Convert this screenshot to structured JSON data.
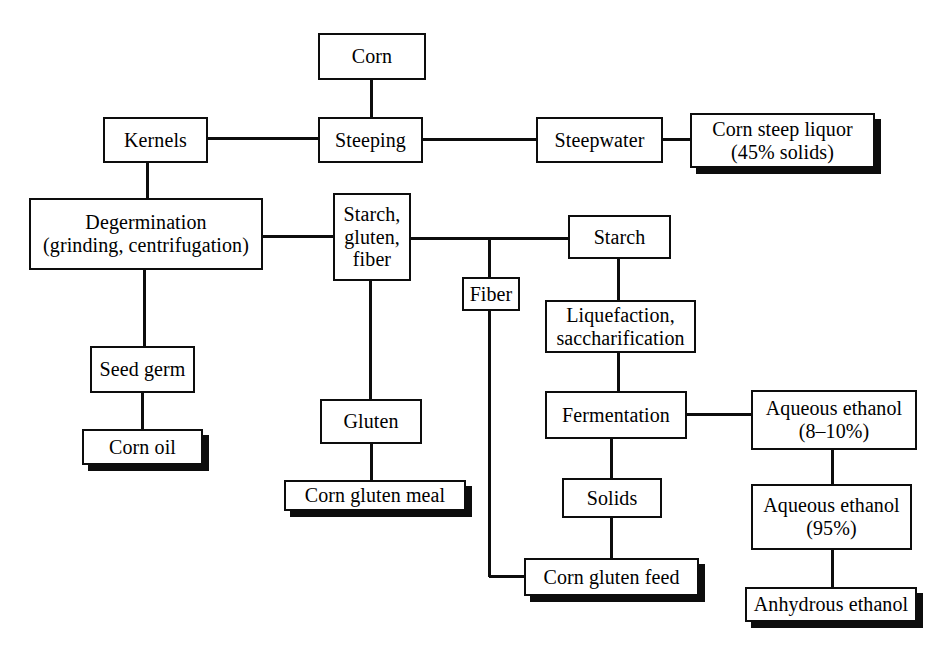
{
  "diagram": {
    "background_color": "#ffffff",
    "line_color": "#0d0d0d",
    "shadow_color": "#0d0d0d",
    "nodes": [
      {
        "id": "corn",
        "label": "Corn",
        "kind": "process",
        "x": 318,
        "y": 33,
        "w": 108,
        "h": 47
      },
      {
        "id": "kernels",
        "label": "Kernels",
        "kind": "process",
        "x": 103,
        "y": 117,
        "w": 105,
        "h": 46
      },
      {
        "id": "steeping",
        "label": "Steeping",
        "kind": "process",
        "x": 318,
        "y": 117,
        "w": 105,
        "h": 46
      },
      {
        "id": "steepwater",
        "label": "Steepwater",
        "kind": "process",
        "x": 536,
        "y": 117,
        "w": 127,
        "h": 46
      },
      {
        "id": "corn-steep-liquor",
        "label": "Corn steep liquor\n(45% solids)",
        "kind": "product",
        "x": 690,
        "y": 113,
        "w": 185,
        "h": 55
      },
      {
        "id": "degermination",
        "label": "Degermination\n(grinding, centrifugation)",
        "kind": "process",
        "x": 29,
        "y": 198,
        "w": 234,
        "h": 72
      },
      {
        "id": "starch-gluten-fiber",
        "label": "Starch,\ngluten,\nfiber",
        "kind": "process",
        "x": 333,
        "y": 193,
        "w": 78,
        "h": 88
      },
      {
        "id": "starch",
        "label": "Starch",
        "kind": "process",
        "x": 568,
        "y": 215,
        "w": 103,
        "h": 44
      },
      {
        "id": "fiber",
        "label": "Fiber",
        "kind": "process",
        "x": 462,
        "y": 277,
        "w": 58,
        "h": 34
      },
      {
        "id": "liquefaction",
        "label": "Liquefaction,\nsaccharification",
        "kind": "process",
        "x": 545,
        "y": 300,
        "w": 151,
        "h": 53
      },
      {
        "id": "seed-germ",
        "label": "Seed germ",
        "kind": "process",
        "x": 90,
        "y": 346,
        "w": 105,
        "h": 47
      },
      {
        "id": "corn-oil",
        "label": "Corn oil",
        "kind": "product",
        "x": 82,
        "y": 429,
        "w": 121,
        "h": 36
      },
      {
        "id": "gluten",
        "label": "Gluten",
        "kind": "process",
        "x": 320,
        "y": 399,
        "w": 102,
        "h": 45
      },
      {
        "id": "corn-gluten-meal",
        "label": "Corn gluten meal",
        "kind": "product",
        "x": 284,
        "y": 480,
        "w": 182,
        "h": 31
      },
      {
        "id": "fermentation",
        "label": "Fermentation",
        "kind": "process",
        "x": 545,
        "y": 391,
        "w": 142,
        "h": 48
      },
      {
        "id": "aqueous-ethanol-8",
        "label": "Aqueous ethanol\n(8–10%)",
        "kind": "process",
        "x": 751,
        "y": 390,
        "w": 166,
        "h": 60
      },
      {
        "id": "solids",
        "label": "Solids",
        "kind": "process",
        "x": 562,
        "y": 478,
        "w": 100,
        "h": 40
      },
      {
        "id": "corn-gluten-feed",
        "label": "Corn gluten feed",
        "kind": "product",
        "x": 524,
        "y": 558,
        "w": 175,
        "h": 38
      },
      {
        "id": "aqueous-ethanol-95",
        "label": "Aqueous ethanol\n(95%)",
        "kind": "process",
        "x": 751,
        "y": 484,
        "w": 161,
        "h": 66
      },
      {
        "id": "anhydrous-ethanol",
        "label": "Anhydrous ethanol",
        "kind": "product",
        "x": 745,
        "y": 587,
        "w": 172,
        "h": 35
      }
    ],
    "edges": [
      {
        "id": "corn-to-steeping",
        "from": "corn",
        "to": "steeping",
        "segments": [
          {
            "o": "v",
            "x": 371,
            "y": 80,
            "len": 37
          }
        ]
      },
      {
        "id": "kernels-to-steeping",
        "from": "kernels",
        "to": "steeping",
        "segments": [
          {
            "o": "h",
            "x": 208,
            "y": 138,
            "len": 110
          }
        ]
      },
      {
        "id": "steeping-to-steepwater",
        "from": "steeping",
        "to": "steepwater",
        "segments": [
          {
            "o": "h",
            "x": 423,
            "y": 139,
            "len": 113
          }
        ]
      },
      {
        "id": "steepwater-to-liquor",
        "from": "steepwater",
        "to": "corn-steep-liquor",
        "segments": [
          {
            "o": "h",
            "x": 663,
            "y": 139,
            "len": 27
          }
        ]
      },
      {
        "id": "kernels-to-degermination",
        "from": "kernels",
        "to": "degermination",
        "segments": [
          {
            "o": "v",
            "x": 147,
            "y": 163,
            "len": 36
          }
        ]
      },
      {
        "id": "degermination-to-sgf",
        "from": "degermination",
        "to": "starch-gluten-fiber",
        "segments": [
          {
            "o": "h",
            "x": 263,
            "y": 236,
            "len": 70
          }
        ]
      },
      {
        "id": "sgf-to-junction",
        "from": "starch-gluten-fiber",
        "to": "starch",
        "segments": [
          {
            "o": "h",
            "x": 411,
            "y": 238,
            "len": 157
          }
        ]
      },
      {
        "id": "junction-to-fiber",
        "from": "starch-gluten-fiber",
        "to": "fiber",
        "segments": [
          {
            "o": "v",
            "x": 489,
            "y": 238,
            "len": 40
          }
        ]
      },
      {
        "id": "starch-to-liquefaction",
        "from": "starch",
        "to": "liquefaction",
        "segments": [
          {
            "o": "v",
            "x": 618,
            "y": 259,
            "len": 42
          }
        ]
      },
      {
        "id": "degermination-to-seedgerm",
        "from": "degermination",
        "to": "seed-germ",
        "segments": [
          {
            "o": "v",
            "x": 144,
            "y": 270,
            "len": 77
          }
        ]
      },
      {
        "id": "seedgerm-to-cornoil",
        "from": "seed-germ",
        "to": "corn-oil",
        "segments": [
          {
            "o": "v",
            "x": 142,
            "y": 393,
            "len": 37
          }
        ]
      },
      {
        "id": "sgf-to-gluten",
        "from": "starch-gluten-fiber",
        "to": "gluten",
        "segments": [
          {
            "o": "v",
            "x": 370,
            "y": 281,
            "len": 119
          }
        ]
      },
      {
        "id": "gluten-to-meal",
        "from": "gluten",
        "to": "corn-gluten-meal",
        "segments": [
          {
            "o": "v",
            "x": 371,
            "y": 444,
            "len": 37
          }
        ]
      },
      {
        "id": "liquefaction-to-fermentation",
        "from": "liquefaction",
        "to": "fermentation",
        "segments": [
          {
            "o": "v",
            "x": 618,
            "y": 353,
            "len": 39
          }
        ]
      },
      {
        "id": "fermentation-to-ethanol8",
        "from": "fermentation",
        "to": "aqueous-ethanol-8",
        "segments": [
          {
            "o": "h",
            "x": 687,
            "y": 414,
            "len": 64
          }
        ]
      },
      {
        "id": "fermentation-to-solids",
        "from": "fermentation",
        "to": "solids",
        "segments": [
          {
            "o": "v",
            "x": 611,
            "y": 439,
            "len": 40
          }
        ]
      },
      {
        "id": "solids-to-feed",
        "from": "solids",
        "to": "corn-gluten-feed",
        "segments": [
          {
            "o": "v",
            "x": 611,
            "y": 518,
            "len": 41
          }
        ]
      },
      {
        "id": "fiber-to-feed",
        "from": "fiber",
        "to": "corn-gluten-feed",
        "segments": [
          {
            "o": "v",
            "x": 489,
            "y": 311,
            "len": 266
          },
          {
            "o": "h",
            "x": 489,
            "y": 576,
            "len": 37
          }
        ]
      },
      {
        "id": "ethanol8-to-ethanol95",
        "from": "aqueous-ethanol-8",
        "to": "aqueous-ethanol-95",
        "segments": [
          {
            "o": "v",
            "x": 832,
            "y": 450,
            "len": 35
          }
        ]
      },
      {
        "id": "ethanol95-to-anhydrous",
        "from": "aqueous-ethanol-95",
        "to": "anhydrous-ethanol",
        "segments": [
          {
            "o": "v",
            "x": 832,
            "y": 550,
            "len": 38
          }
        ]
      }
    ]
  }
}
